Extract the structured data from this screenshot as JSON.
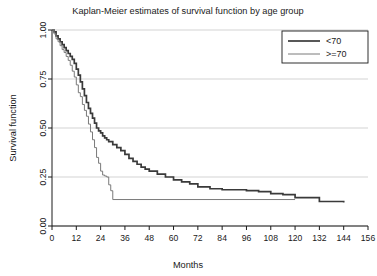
{
  "chart_data": {
    "type": "line",
    "title": "Kaplan-Meier estimates of survival function by age group",
    "xlabel": "Months",
    "ylabel": "Survival function",
    "xlim": [
      0,
      156
    ],
    "ylim": [
      0,
      1.0
    ],
    "grid": true,
    "legend_position": "top-right",
    "xticks": [
      0,
      12,
      24,
      36,
      48,
      60,
      72,
      84,
      96,
      108,
      120,
      132,
      144,
      156
    ],
    "xtick_labels": [
      "0",
      "12",
      "24",
      "36",
      "48",
      "60",
      "72",
      "84",
      "96",
      "108",
      "120",
      "132",
      "144",
      "156"
    ],
    "yticks": [
      0.0,
      0.25,
      0.5,
      0.75,
      1.0
    ],
    "ytick_labels": [
      "0.00",
      "0.25",
      "0.50",
      "0.75",
      "1.00"
    ],
    "series": [
      {
        "name": "<70",
        "legend_label": "<70",
        "color": "#3a3a3a",
        "line_width": 1.7,
        "step": "post",
        "x": [
          0,
          1,
          2,
          3,
          4,
          5,
          6,
          7,
          8,
          9,
          10,
          11,
          12,
          13,
          14,
          15,
          16,
          17,
          18,
          19,
          20,
          21,
          22,
          23,
          24,
          25,
          26,
          27,
          28,
          30,
          32,
          34,
          36,
          38,
          40,
          42,
          44,
          46,
          48,
          52,
          56,
          60,
          64,
          68,
          72,
          78,
          84,
          90,
          96,
          102,
          108,
          114,
          120,
          132,
          144
        ],
        "y": [
          1.0,
          0.99,
          0.97,
          0.955,
          0.94,
          0.925,
          0.91,
          0.895,
          0.88,
          0.865,
          0.85,
          0.83,
          0.8,
          0.77,
          0.735,
          0.7,
          0.665,
          0.63,
          0.6,
          0.575,
          0.55,
          0.525,
          0.5,
          0.485,
          0.475,
          0.46,
          0.45,
          0.44,
          0.43,
          0.415,
          0.4,
          0.385,
          0.365,
          0.345,
          0.33,
          0.315,
          0.3,
          0.29,
          0.28,
          0.265,
          0.25,
          0.235,
          0.225,
          0.215,
          0.2,
          0.19,
          0.185,
          0.185,
          0.18,
          0.175,
          0.165,
          0.16,
          0.145,
          0.125,
          0.12
        ]
      },
      {
        "name": ">=70",
        "legend_label": ">=70",
        "color": "#7a7a7a",
        "line_width": 1.0,
        "step": "post",
        "x": [
          0,
          1,
          2,
          3,
          4,
          5,
          6,
          7,
          8,
          9,
          10,
          11,
          12,
          13,
          14,
          15,
          16,
          17,
          18,
          19,
          20,
          21,
          22,
          23,
          24,
          25,
          26,
          27,
          28,
          29,
          30,
          120
        ],
        "y": [
          1.0,
          0.98,
          0.955,
          0.94,
          0.92,
          0.9,
          0.885,
          0.865,
          0.845,
          0.82,
          0.79,
          0.76,
          0.72,
          0.68,
          0.66,
          0.62,
          0.59,
          0.56,
          0.52,
          0.48,
          0.44,
          0.4,
          0.35,
          0.32,
          0.28,
          0.26,
          0.255,
          0.25,
          0.21,
          0.18,
          0.135,
          0.135
        ]
      }
    ]
  }
}
